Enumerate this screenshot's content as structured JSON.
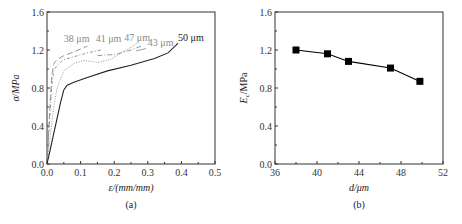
{
  "chart_data": [
    {
      "panel": "(a)",
      "type": "line",
      "xlabel": "ε/(mm/mm)",
      "ylabel": "σ/MPa",
      "xlim": [
        0.0,
        0.5
      ],
      "ylim": [
        0.0,
        1.6
      ],
      "xticks": [
        "0.0",
        "0.1",
        "0.2",
        "0.3",
        "0.4",
        "0.5"
      ],
      "yticks": [
        "0.0",
        "0.4",
        "0.8",
        "1.2",
        "1.6"
      ],
      "grid": false,
      "series": [
        {
          "name": "38 μm",
          "color": "#8a8a8a",
          "dash": "6,3",
          "x": [
            0,
            0.005,
            0.01,
            0.015,
            0.02,
            0.025,
            0.03,
            0.05,
            0.08,
            0.1,
            0.12
          ],
          "y": [
            0,
            0.35,
            0.7,
            0.95,
            1.05,
            1.08,
            1.1,
            1.14,
            1.18,
            1.21,
            1.24
          ]
        },
        {
          "name": "41 μm",
          "color": "#8a8a8a",
          "dash": "3,2,1,2",
          "x": [
            0,
            0.005,
            0.01,
            0.015,
            0.02,
            0.03,
            0.05,
            0.08,
            0.12,
            0.16
          ],
          "y": [
            0,
            0.3,
            0.6,
            0.85,
            0.98,
            1.04,
            1.1,
            1.13,
            1.17,
            1.2
          ]
        },
        {
          "name": "47 μm",
          "color": "#8a8a8a",
          "dash": "1,1.5",
          "x": [
            0,
            0.01,
            0.02,
            0.03,
            0.05,
            0.08,
            0.11,
            0.15,
            0.19,
            0.22,
            0.25,
            0.27
          ],
          "y": [
            0,
            0.3,
            0.6,
            0.8,
            0.98,
            1.06,
            1.09,
            1.07,
            1.1,
            1.17,
            1.23,
            1.28
          ]
        },
        {
          "name": "43 μm",
          "color": "#8a8a8a",
          "dash": "5,2,1,2",
          "x": [
            0.15,
            0.18,
            0.2,
            0.22,
            0.25,
            0.28
          ],
          "y": [
            1.14,
            1.15,
            1.15,
            1.17,
            1.2,
            1.24
          ]
        },
        {
          "name": "50 μm",
          "color": "#222222",
          "dash": "",
          "x": [
            0,
            0.01,
            0.02,
            0.03,
            0.04,
            0.05,
            0.06,
            0.08,
            0.12,
            0.18,
            0.25,
            0.32,
            0.36,
            0.39
          ],
          "y": [
            0,
            0.16,
            0.32,
            0.48,
            0.64,
            0.78,
            0.83,
            0.86,
            0.91,
            0.98,
            1.04,
            1.11,
            1.17,
            1.27
          ]
        }
      ],
      "annotations": [
        {
          "text": "38 μm",
          "x": 0.05,
          "y": 1.28,
          "color": "#8a8a8a"
        },
        {
          "text": "41 μm",
          "x": 0.145,
          "y": 1.28,
          "color": "#8a8a8a"
        },
        {
          "text": "47 μm",
          "x": 0.23,
          "y": 1.29,
          "color": "#8a8a8a"
        },
        {
          "text": "43 μm",
          "x": 0.3,
          "y": 1.24,
          "color": "#8a8a8a"
        },
        {
          "text": "50 μm",
          "x": 0.39,
          "y": 1.29,
          "color": "#222222"
        }
      ],
      "caption": "(a)"
    },
    {
      "panel": "(b)",
      "type": "line",
      "xlabel": "d/μm",
      "ylabel": "Ec/MPa",
      "ylabel_main": "E",
      "ylabel_sub": "c",
      "ylabel_rest": "/MPa",
      "xlim": [
        36,
        52
      ],
      "ylim": [
        0.0,
        1.6
      ],
      "xticks": [
        "36",
        "40",
        "44",
        "48",
        "52"
      ],
      "yticks": [
        "0.0",
        "0.4",
        "0.8",
        "1.2",
        "1.6"
      ],
      "grid": false,
      "series": [
        {
          "name": "Ec",
          "marker": "square",
          "color": "#000000",
          "x": [
            38,
            41,
            43,
            47,
            49.8
          ],
          "y": [
            1.2,
            1.16,
            1.08,
            1.01,
            0.87
          ]
        }
      ],
      "caption": "(b)"
    }
  ]
}
